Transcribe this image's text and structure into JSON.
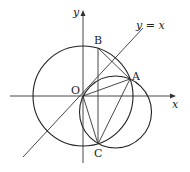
{
  "diagram": {
    "type": "coordinate-geometry",
    "axes": {
      "x_label": "x",
      "y_label": "y"
    },
    "line_label": "y = x",
    "points": {
      "O": "O",
      "A": "A",
      "B": "B",
      "C": "C"
    },
    "colors": {
      "stroke": "#222222",
      "background": "#ffffff"
    }
  }
}
